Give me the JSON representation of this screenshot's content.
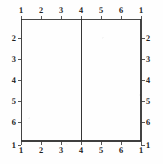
{
  "figure": {
    "type": "technical-line-diagram",
    "background_color": "#fefefe",
    "line_color": "#2a2a2a",
    "label_color": "#1f1f1f"
  },
  "chart_data": {
    "type": "line",
    "title": "",
    "xlabel": "",
    "ylabel": "",
    "grid": false,
    "legend": null,
    "xlim": [
      1,
      1
    ],
    "ylim": [
      1,
      1
    ],
    "axes": {
      "top": {
        "tick_labels": [
          "1",
          "2",
          "3",
          "4",
          "5",
          "6",
          "1"
        ],
        "tick_positions": [
          21,
          41,
          61,
          81,
          101,
          121,
          141
        ]
      },
      "bottom": {
        "tick_labels": [
          "1",
          "2",
          "3",
          "4",
          "5",
          "6",
          "1"
        ],
        "tick_positions": [
          21,
          41,
          61,
          81,
          101,
          121,
          141
        ]
      },
      "left": {
        "tick_labels": [
          "2",
          "3",
          "4",
          "5",
          "6",
          "1"
        ],
        "tick_positions": [
          38,
          59,
          80,
          101,
          122,
          145
        ]
      },
      "right": {
        "tick_labels": [
          "2",
          "3",
          "4",
          "5",
          "6",
          "1"
        ],
        "tick_positions": [
          38,
          59,
          80,
          101,
          122,
          145
        ]
      }
    },
    "series": [
      {
        "name": "frame-outline",
        "shape": "rectangle",
        "x": [
          21,
          141,
          141,
          21,
          21
        ],
        "y": [
          19,
          19,
          141,
          141,
          19
        ]
      },
      {
        "name": "center-divider",
        "shape": "vertical-line",
        "x": [
          81,
          81
        ],
        "y": [
          19,
          141
        ]
      }
    ]
  }
}
